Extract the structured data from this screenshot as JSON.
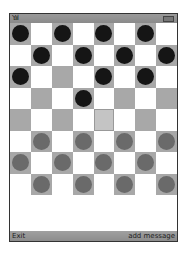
{
  "status_bar": {
    "signal_icon": "signal-icon",
    "signal_text": "Y.ııl",
    "battery_icon": "battery-icon"
  },
  "board": {
    "rows": 8,
    "cols": 8,
    "pieces": [
      [
        "black",
        null,
        "black",
        null,
        "black",
        null,
        "black",
        null
      ],
      [
        null,
        "black",
        null,
        "black",
        null,
        "black",
        null,
        "black"
      ],
      [
        "black",
        null,
        null,
        null,
        "black",
        null,
        "black",
        null
      ],
      [
        null,
        null,
        null,
        "black",
        null,
        null,
        null,
        null
      ],
      [
        null,
        null,
        null,
        null,
        null,
        null,
        null,
        null
      ],
      [
        null,
        "gray",
        null,
        "gray",
        null,
        "gray",
        null,
        "gray"
      ],
      [
        "gray",
        null,
        "gray",
        null,
        "gray",
        null,
        "gray",
        null
      ],
      [
        null,
        "gray",
        null,
        "gray",
        null,
        "gray",
        null,
        "gray"
      ]
    ],
    "selected": {
      "row": 4,
      "col": 4
    },
    "colors": {
      "dark_square": "#a8a8a8",
      "light_square": "#ffffff",
      "black_piece": "#151515",
      "gray_piece": "#6a6a6a"
    }
  },
  "softkeys": {
    "left": "Exit",
    "right": "add message"
  }
}
